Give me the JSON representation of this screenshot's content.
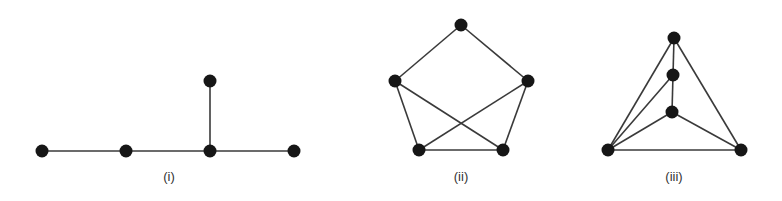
{
  "figure": {
    "colors": {
      "node": "#161616",
      "edge": "#3a3a3a",
      "label": "#333333",
      "background": "#ffffff"
    },
    "graphs": [
      {
        "label": "(i)",
        "label_pos": [
          169,
          181
        ],
        "nodes": [
          [
            42,
            151
          ],
          [
            126,
            151
          ],
          [
            210,
            151
          ],
          [
            294,
            151
          ],
          [
            210,
            81
          ]
        ],
        "edges": [
          [
            0,
            1
          ],
          [
            1,
            2
          ],
          [
            2,
            3
          ],
          [
            2,
            4
          ]
        ]
      },
      {
        "label": "(ii)",
        "label_pos": [
          461,
          181
        ],
        "nodes": [
          [
            461,
            25
          ],
          [
            395,
            81
          ],
          [
            528,
            81
          ],
          [
            419,
            150
          ],
          [
            503,
            150
          ]
        ],
        "edges": [
          [
            0,
            1
          ],
          [
            0,
            2
          ],
          [
            1,
            3
          ],
          [
            1,
            4
          ],
          [
            2,
            3
          ],
          [
            2,
            4
          ],
          [
            3,
            4
          ]
        ]
      },
      {
        "label": "(iii)",
        "label_pos": [
          674,
          181
        ],
        "nodes": [
          [
            674,
            38
          ],
          [
            673,
            75
          ],
          [
            672,
            112
          ],
          [
            608,
            150
          ],
          [
            741,
            150
          ]
        ],
        "edges": [
          [
            0,
            1
          ],
          [
            1,
            2
          ],
          [
            0,
            3
          ],
          [
            0,
            4
          ],
          [
            1,
            3
          ],
          [
            2,
            3
          ],
          [
            2,
            4
          ],
          [
            3,
            4
          ]
        ]
      }
    ]
  }
}
